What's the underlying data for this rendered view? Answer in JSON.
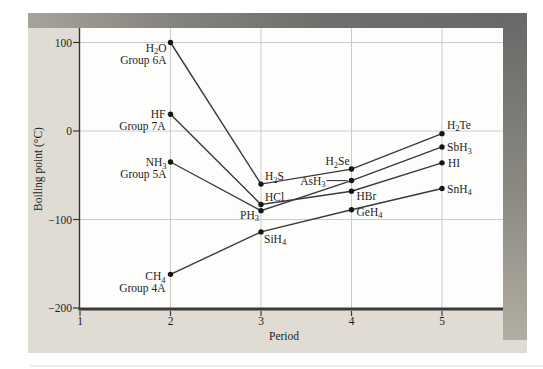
{
  "figure": {
    "kind": "scanned textbook line chart",
    "x_axis_title": "Period",
    "y_axis_title": "Boiling point (°C)"
  },
  "chart_data": {
    "type": "line",
    "title": "",
    "xlabel": "Period",
    "ylabel": "Boiling point (°C)",
    "xlim": [
      1,
      5.7
    ],
    "ylim": [
      -201,
      116
    ],
    "grid": true,
    "legend": "none (labels next to points)",
    "x_ticks": [
      1,
      2,
      3,
      4,
      5
    ],
    "y_ticks": [
      100,
      0,
      -100,
      -200
    ],
    "y_tick_labels": [
      "100",
      "0",
      "−100",
      "−200"
    ],
    "series": [
      {
        "name": "Group 6A",
        "points": [
          {
            "formula": "H_2O",
            "period": 2,
            "bp": 100,
            "group_label": "Group 6A",
            "label_anchor": "end",
            "label_dx": -4,
            "label_dy": 9
          },
          {
            "formula": "H_2S",
            "period": 3,
            "bp": -60,
            "label_anchor": "start",
            "label_dx": 4,
            "label_dy": -4
          },
          {
            "formula": "H_2Se",
            "period": 4,
            "bp": -43,
            "label_anchor": "end",
            "label_dx": -2,
            "label_dy": -4
          },
          {
            "formula": "H_2Te",
            "period": 5,
            "bp": -3,
            "label_anchor": "start",
            "label_dx": 5,
            "label_dy": -5
          }
        ]
      },
      {
        "name": "Group 7A",
        "points": [
          {
            "formula": "HF",
            "period": 2,
            "bp": 19,
            "group_label": "Group 7A",
            "label_anchor": "end",
            "label_dx": -5,
            "label_dy": 4
          },
          {
            "formula": "HCl",
            "period": 3,
            "bp": -83,
            "label_anchor": "start",
            "label_dx": 4,
            "label_dy": -3
          },
          {
            "formula": "HBr",
            "period": 4,
            "bp": -68,
            "label_anchor": "start",
            "label_dx": 5,
            "label_dy": 9
          },
          {
            "formula": "HI",
            "period": 5,
            "bp": -36,
            "label_anchor": "start",
            "label_dx": 6,
            "label_dy": 4
          }
        ]
      },
      {
        "name": "Group 5A",
        "points": [
          {
            "formula": "NH_3",
            "period": 2,
            "bp": -35,
            "group_label": "Group 5A",
            "label_anchor": "end",
            "label_dx": -4,
            "label_dy": 4
          },
          {
            "formula": "PH_3",
            "period": 3,
            "bp": -90,
            "label_anchor": "end",
            "label_dx": -2,
            "label_dy": 8
          },
          {
            "formula": "AsH_3",
            "period": 4,
            "bp": -56,
            "label_anchor": "end",
            "label_dx": -26,
            "label_dy": 4,
            "leader_line": true
          },
          {
            "formula": "SbH_3",
            "period": 5,
            "bp": -18,
            "label_anchor": "start",
            "label_dx": 5,
            "label_dy": 4
          }
        ]
      },
      {
        "name": "Group 4A",
        "points": [
          {
            "formula": "CH_4",
            "period": 2,
            "bp": -162,
            "group_label": "Group 4A",
            "label_anchor": "end",
            "label_dx": -5,
            "label_dy": 6
          },
          {
            "formula": "SiH_4",
            "period": 3,
            "bp": -114,
            "label_anchor": "start",
            "label_dx": 3,
            "label_dy": 11
          },
          {
            "formula": "GeH_4",
            "period": 4,
            "bp": -89,
            "label_anchor": "start",
            "label_dx": 5,
            "label_dy": 6
          },
          {
            "formula": "SnH_4",
            "period": 5,
            "bp": -65,
            "label_anchor": "start",
            "label_dx": 5,
            "label_dy": 4
          }
        ]
      }
    ],
    "colors": {
      "panel_bg": "#e0dcd4",
      "plot_bg": "#fdfdfc",
      "grid": "#cbcbc9",
      "line": "#3a3a3a",
      "dot": "#151513",
      "text": "#1e1e1c",
      "axis": "#3a3a38",
      "shadow_dark": "#686867",
      "shadow_light": "#b2ada2"
    }
  }
}
